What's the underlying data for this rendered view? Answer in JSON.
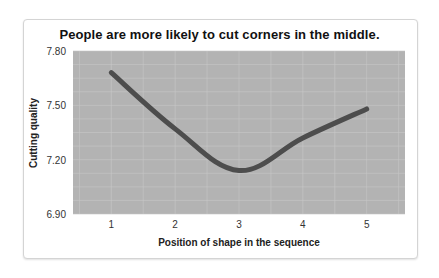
{
  "chart_data": {
    "type": "line",
    "title": "People are more likely to cut corners in the middle.",
    "xlabel": "Position of shape in the sequence",
    "ylabel": "Cutting quality",
    "categories": [
      "1",
      "2",
      "3",
      "4",
      "5"
    ],
    "x": [
      1,
      2,
      3,
      4,
      5
    ],
    "values": [
      7.68,
      7.37,
      7.14,
      7.32,
      7.48
    ],
    "series": [
      {
        "name": "Cutting quality",
        "values": [
          7.68,
          7.37,
          7.14,
          7.32,
          7.48
        ]
      }
    ],
    "yticks": [
      "7.80",
      "7.50",
      "7.20",
      "6.90"
    ],
    "ylim": [
      6.9,
      7.8
    ],
    "xlim": [
      0.4,
      5.6
    ],
    "grid": true,
    "legend": "none",
    "colors": {
      "plot_bg": "#b3b3b3",
      "grid": "#c8c8c8",
      "line": "#4d4d4d"
    }
  }
}
